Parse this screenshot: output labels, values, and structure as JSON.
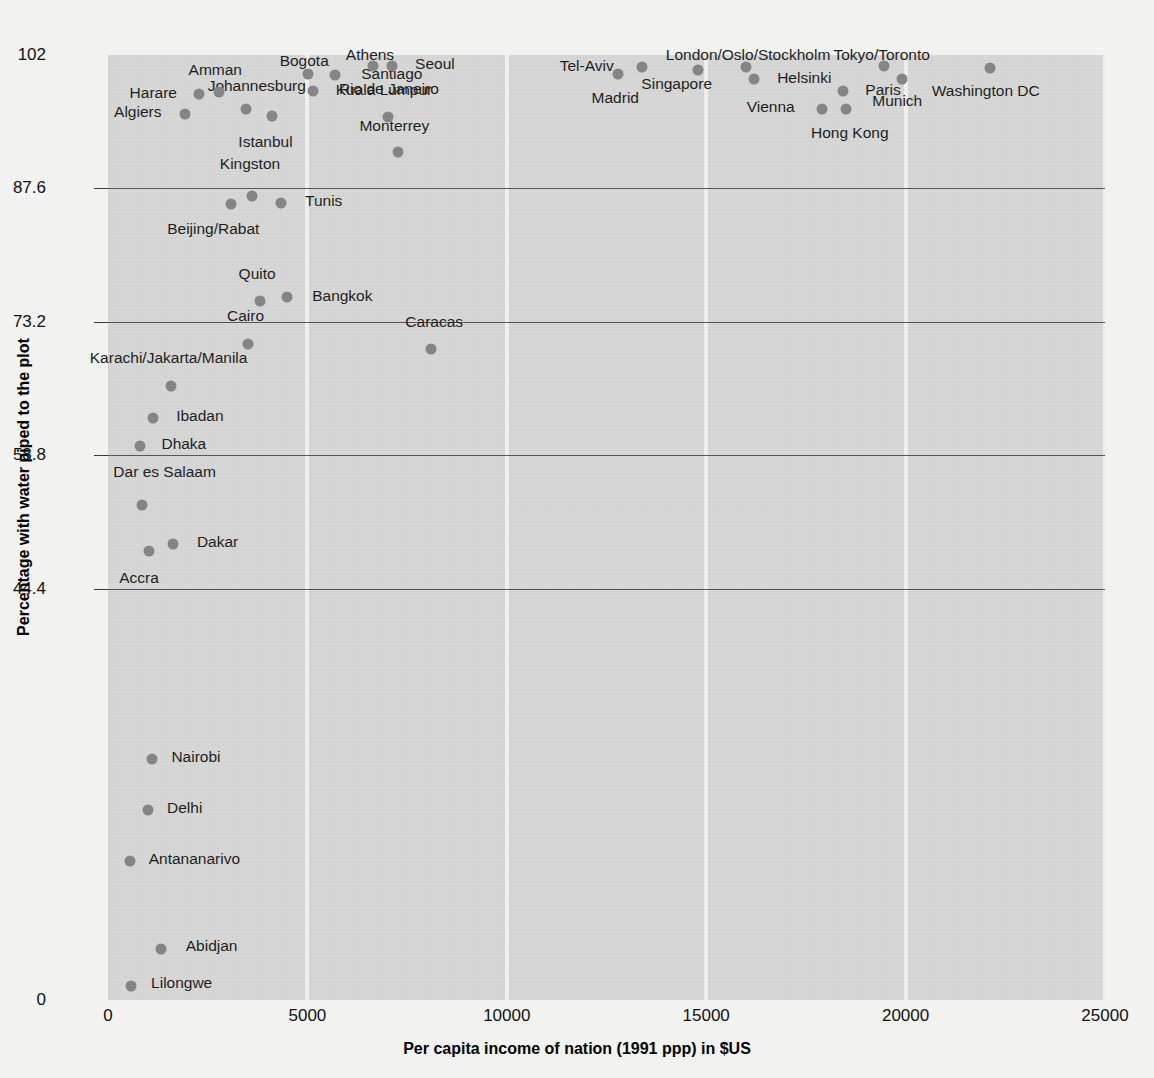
{
  "chart_data": {
    "type": "scatter",
    "title": "",
    "xlabel": "Per capita income of nation (1991 ppp) in $US",
    "ylabel": "Percentage with water piped to the plot",
    "xlim": [
      0,
      25000
    ],
    "ylim": [
      0,
      102
    ],
    "xticks": [
      "0",
      "5000",
      "10000",
      "15000",
      "20000",
      "25000"
    ],
    "xtick_values": [
      0,
      5000,
      10000,
      15000,
      20000,
      25000
    ],
    "yticks": [
      "0",
      "44.4",
      "58.8",
      "73.2",
      "87.6",
      "102"
    ],
    "ytick_values": [
      0,
      44.4,
      58.8,
      73.2,
      87.6,
      102
    ],
    "grid": "vertical gridlines at x ticks (light); horizontal gridlines at 44.4, 58.8, 73.2, 87.6 (dark)",
    "legend": "none",
    "marker_color": "#858585",
    "plot_background": "#d6d6d6",
    "page_background": "#f2f2f0",
    "points": [
      {
        "label": "Lilongwe",
        "x": 580,
        "y": 1.5,
        "lx": 1080,
        "ly": 1.8,
        "anchor": "right"
      },
      {
        "label": "Abidjan",
        "x": 1320,
        "y": 5.5,
        "lx": 1950,
        "ly": 5.8,
        "anchor": "right"
      },
      {
        "label": "Antananarivo",
        "x": 540,
        "y": 15.0,
        "lx": 1020,
        "ly": 15.2,
        "anchor": "right"
      },
      {
        "label": "Delhi",
        "x": 1000,
        "y": 20.5,
        "lx": 1480,
        "ly": 20.7,
        "anchor": "right"
      },
      {
        "label": "Nairobi",
        "x": 1100,
        "y": 26.0,
        "lx": 1590,
        "ly": 26.2,
        "anchor": "right"
      },
      {
        "label": "Accra",
        "x": 1030,
        "y": 48.5,
        "lx": 780,
        "ly": 45.5,
        "anchor": "center"
      },
      {
        "label": "Dakar",
        "x": 1620,
        "y": 49.2,
        "lx": 2230,
        "ly": 49.4,
        "anchor": "right"
      },
      {
        "label": "Dar es Salaam",
        "x": 850,
        "y": 53.4,
        "lx": 1420,
        "ly": 57.0,
        "anchor": "center"
      },
      {
        "label": "Dhaka",
        "x": 800,
        "y": 59.8,
        "lx": 1340,
        "ly": 60.0,
        "anchor": "right"
      },
      {
        "label": "Ibadan",
        "x": 1130,
        "y": 62.8,
        "lx": 1710,
        "ly": 63.0,
        "anchor": "right"
      },
      {
        "label": "Karachi/Jakarta/Manila",
        "x": 1580,
        "y": 66.3,
        "lx": 1520,
        "ly": 69.3,
        "anchor": "center"
      },
      {
        "label": "Caracas",
        "x": 8100,
        "y": 70.3,
        "lx": 8180,
        "ly": 73.2,
        "anchor": "center"
      },
      {
        "label": "Cairo",
        "x": 3520,
        "y": 70.8,
        "lx": 3450,
        "ly": 73.8,
        "anchor": "center"
      },
      {
        "label": "Bangkok",
        "x": 4480,
        "y": 75.9,
        "lx": 5120,
        "ly": 76.0,
        "anchor": "right"
      },
      {
        "label": "Quito",
        "x": 3800,
        "y": 75.5,
        "lx": 3740,
        "ly": 78.4,
        "anchor": "center"
      },
      {
        "label": "Tunis",
        "x": 4340,
        "y": 86.0,
        "lx": 4940,
        "ly": 86.2,
        "anchor": "right"
      },
      {
        "label": "Kingston",
        "x": 3620,
        "y": 86.8,
        "lx": 3560,
        "ly": 90.2,
        "anchor": "center"
      },
      {
        "label": "Beijing/Rabat",
        "x": 3090,
        "y": 85.9,
        "lx": 2640,
        "ly": 83.2,
        "anchor": "center"
      },
      {
        "label": "Monterrey",
        "x": 7280,
        "y": 91.5,
        "lx": 7180,
        "ly": 94.3,
        "anchor": "center"
      },
      {
        "label": "Istanbul",
        "x": 4110,
        "y": 95.4,
        "lx": 3950,
        "ly": 92.6,
        "anchor": "center"
      },
      {
        "label": "Algiers",
        "x": 1930,
        "y": 95.6,
        "lx": 1340,
        "ly": 95.8,
        "anchor": "left"
      },
      {
        "label": "Kuala Lumpur",
        "x": 7010,
        "y": 95.3,
        "lx": 6920,
        "ly": 98.2,
        "anchor": "center"
      },
      {
        "label": "Johannesburg",
        "x": 3470,
        "y": 96.2,
        "lx": 3730,
        "ly": 98.7,
        "anchor": "center"
      },
      {
        "label": "Harare",
        "x": 2290,
        "y": 97.8,
        "lx": 1730,
        "ly": 97.9,
        "anchor": "left"
      },
      {
        "label": "Amman",
        "x": 2790,
        "y": 98.0,
        "lx": 2690,
        "ly": 100.4,
        "anchor": "center"
      },
      {
        "label": "Vienna",
        "x": 17900,
        "y": 96.2,
        "lx": 17220,
        "ly": 96.4,
        "anchor": "left"
      },
      {
        "label": "Hong Kong",
        "x": 18500,
        "y": 96.2,
        "lx": 18600,
        "ly": 93.6,
        "anchor": "center"
      },
      {
        "label": "Rio de Janeiro",
        "x": 5130,
        "y": 98.1,
        "lx": 5790,
        "ly": 98.3,
        "anchor": "right"
      },
      {
        "label": "Paris",
        "x": 18430,
        "y": 98.1,
        "lx": 18990,
        "ly": 98.2,
        "anchor": "right"
      },
      {
        "label": "Helsinki",
        "x": 16200,
        "y": 99.4,
        "lx": 16780,
        "ly": 99.5,
        "anchor": "right"
      },
      {
        "label": "Munich",
        "x": 19900,
        "y": 99.4,
        "lx": 19790,
        "ly": 97.0,
        "anchor": "center"
      },
      {
        "label": "Santiago",
        "x": 5700,
        "y": 99.8,
        "lx": 6350,
        "ly": 99.9,
        "anchor": "right"
      },
      {
        "label": "Singapore",
        "x": 14800,
        "y": 100.4,
        "lx": 14260,
        "ly": 98.9,
        "anchor": "center"
      },
      {
        "label": "Madrid",
        "x": 12800,
        "y": 99.9,
        "lx": 12720,
        "ly": 97.4,
        "anchor": "center"
      },
      {
        "label": "Tel-Aviv",
        "x": 13400,
        "y": 100.7,
        "lx": 12680,
        "ly": 100.8,
        "anchor": "left"
      },
      {
        "label": "London/Oslo/Stockholm",
        "x": 16010,
        "y": 100.7,
        "lx": 16050,
        "ly": 102.0,
        "anchor": "center"
      },
      {
        "label": "Bogota",
        "x": 5010,
        "y": 100.0,
        "lx": 4920,
        "ly": 101.4,
        "anchor": "center"
      },
      {
        "label": "Athens",
        "x": 6650,
        "y": 100.8,
        "lx": 6570,
        "ly": 102.0,
        "anchor": "center"
      },
      {
        "label": "Seoul",
        "x": 7110,
        "y": 100.8,
        "lx": 7700,
        "ly": 101.0,
        "anchor": "right"
      },
      {
        "label": "Tokyo/Toronto",
        "x": 19450,
        "y": 100.8,
        "lx": 19400,
        "ly": 102.0,
        "anchor": "center"
      },
      {
        "label": "Washington DC",
        "x": 22120,
        "y": 100.6,
        "lx": 22010,
        "ly": 98.1,
        "anchor": "center"
      }
    ]
  }
}
